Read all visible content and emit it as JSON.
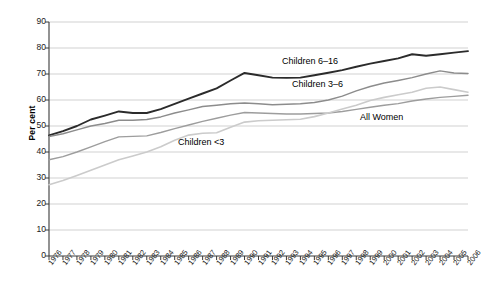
{
  "chart_data": {
    "type": "line",
    "title": "",
    "xlabel": "",
    "ylabel": "Per cent",
    "ylim": [
      0,
      90
    ],
    "ytick_values": [
      0,
      10,
      20,
      30,
      40,
      50,
      60,
      70,
      80,
      90
    ],
    "ytick_labels": [
      "0",
      "10",
      "20",
      "30",
      "40",
      "50",
      "60",
      "70",
      "80",
      "90"
    ],
    "grid": true,
    "legend_position": "inline-annotations",
    "x": [
      1976,
      1977,
      1978,
      1979,
      1980,
      1981,
      1982,
      1983,
      1984,
      1985,
      1986,
      1987,
      1988,
      1989,
      1990,
      1991,
      1992,
      1993,
      1994,
      1995,
      1996,
      1997,
      1998,
      1999,
      2000,
      2001,
      2002,
      2003,
      2004,
      2005,
      2006
    ],
    "xtick_labels": [
      "1976",
      "1977",
      "1978",
      "1979",
      "1980",
      "1981",
      "1982",
      "1983",
      "1984",
      "1985",
      "1986",
      "1987",
      "1988",
      "1989",
      "1990",
      "1991",
      "1992",
      "1993",
      "1994",
      "1995",
      "1996",
      "1997",
      "1998",
      "1999",
      "2000",
      "2001",
      "2002",
      "2003",
      "2004",
      "2005",
      "2006"
    ],
    "series": [
      {
        "name": "Children 6-16",
        "label": "Children 6–16",
        "color": "#2b2b2b",
        "width": 1.9,
        "values": [
          46.4,
          48.0,
          50.0,
          52.5,
          54.0,
          55.6,
          55.0,
          55.0,
          56.5,
          58.5,
          60.5,
          62.5,
          64.5,
          67.5,
          70.4,
          69.5,
          68.6,
          68.5,
          68.6,
          69.5,
          70.5,
          71.5,
          72.8,
          74.0,
          75.0,
          76.0,
          77.6,
          77.0,
          77.6,
          78.2,
          78.8
        ]
      },
      {
        "name": "Children 3-6",
        "label": "Children 3–6",
        "color": "#8c8c8c",
        "width": 1.5,
        "values": [
          46.0,
          47.0,
          48.5,
          50.0,
          51.0,
          52.2,
          52.2,
          52.5,
          53.5,
          55.0,
          56.2,
          57.5,
          58.0,
          58.6,
          58.8,
          58.6,
          58.2,
          58.4,
          58.6,
          59.0,
          60.0,
          61.5,
          63.5,
          65.2,
          66.5,
          67.5,
          68.6,
          70.0,
          71.2,
          70.4,
          70.2
        ]
      },
      {
        "name": "All Women",
        "label": "All Women",
        "color": "#9d9d9d",
        "width": 1.4,
        "values": [
          37.0,
          38.2,
          40.0,
          42.0,
          44.0,
          45.8,
          46.0,
          46.2,
          47.5,
          49.0,
          50.4,
          51.8,
          53.0,
          54.2,
          55.2,
          55.0,
          54.8,
          54.6,
          54.6,
          54.8,
          55.0,
          55.6,
          56.4,
          57.2,
          58.0,
          58.6,
          59.6,
          60.4,
          61.0,
          61.4,
          61.8
        ]
      },
      {
        "name": "Children <3",
        "label": "Children <3",
        "color": "#cbcbcb",
        "width": 1.6,
        "values": [
          27.4,
          29.0,
          31.0,
          33.0,
          35.0,
          37.0,
          38.5,
          40.0,
          42.0,
          44.5,
          46.5,
          47.2,
          47.4,
          49.5,
          51.5,
          52.0,
          52.2,
          52.4,
          52.6,
          53.6,
          55.0,
          56.5,
          58.0,
          59.8,
          61.0,
          62.0,
          63.0,
          64.5,
          65.0,
          64.0,
          63.0
        ]
      }
    ],
    "annotations": [
      {
        "text": "Children 6–16",
        "x_px": 282,
        "y_px": 56
      },
      {
        "text": "Children 3–6",
        "x_px": 292,
        "y_px": 79
      },
      {
        "text": "All Women",
        "x_px": 360,
        "y_px": 112
      },
      {
        "text": "Children <3",
        "x_px": 178,
        "y_px": 137
      }
    ]
  }
}
